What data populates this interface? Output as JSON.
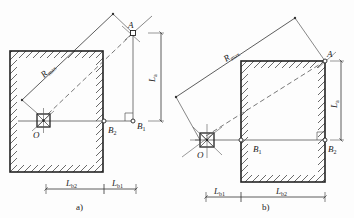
{
  "diagram": {
    "panels": [
      {
        "id": "a",
        "caption": "a)",
        "labels": {
          "A": "A",
          "O": "O",
          "B1": "B",
          "B1_sub": "1",
          "B2": "B",
          "B2_sub": "2",
          "R": "R",
          "R_sub": "max",
          "La": "L",
          "La_sub": "a",
          "Lb1": "L",
          "Lb1_sub": "b1",
          "Lb2": "L",
          "Lb2_sub": "b2"
        }
      },
      {
        "id": "b",
        "caption": "b)",
        "labels": {
          "A": "A",
          "O": "O",
          "B1": "B",
          "B1_sub": "1",
          "B2": "B",
          "B2_sub": "2",
          "R": "R",
          "R_sub": "max",
          "La": "L",
          "La_sub": "a",
          "Lb1": "L",
          "Lb1_sub": "b1",
          "Lb2": "L",
          "Lb2_sub": "b2"
        }
      }
    ],
    "colors": {
      "line": "#333333",
      "hatch": "#444444",
      "background": "#fdfdfd"
    }
  }
}
